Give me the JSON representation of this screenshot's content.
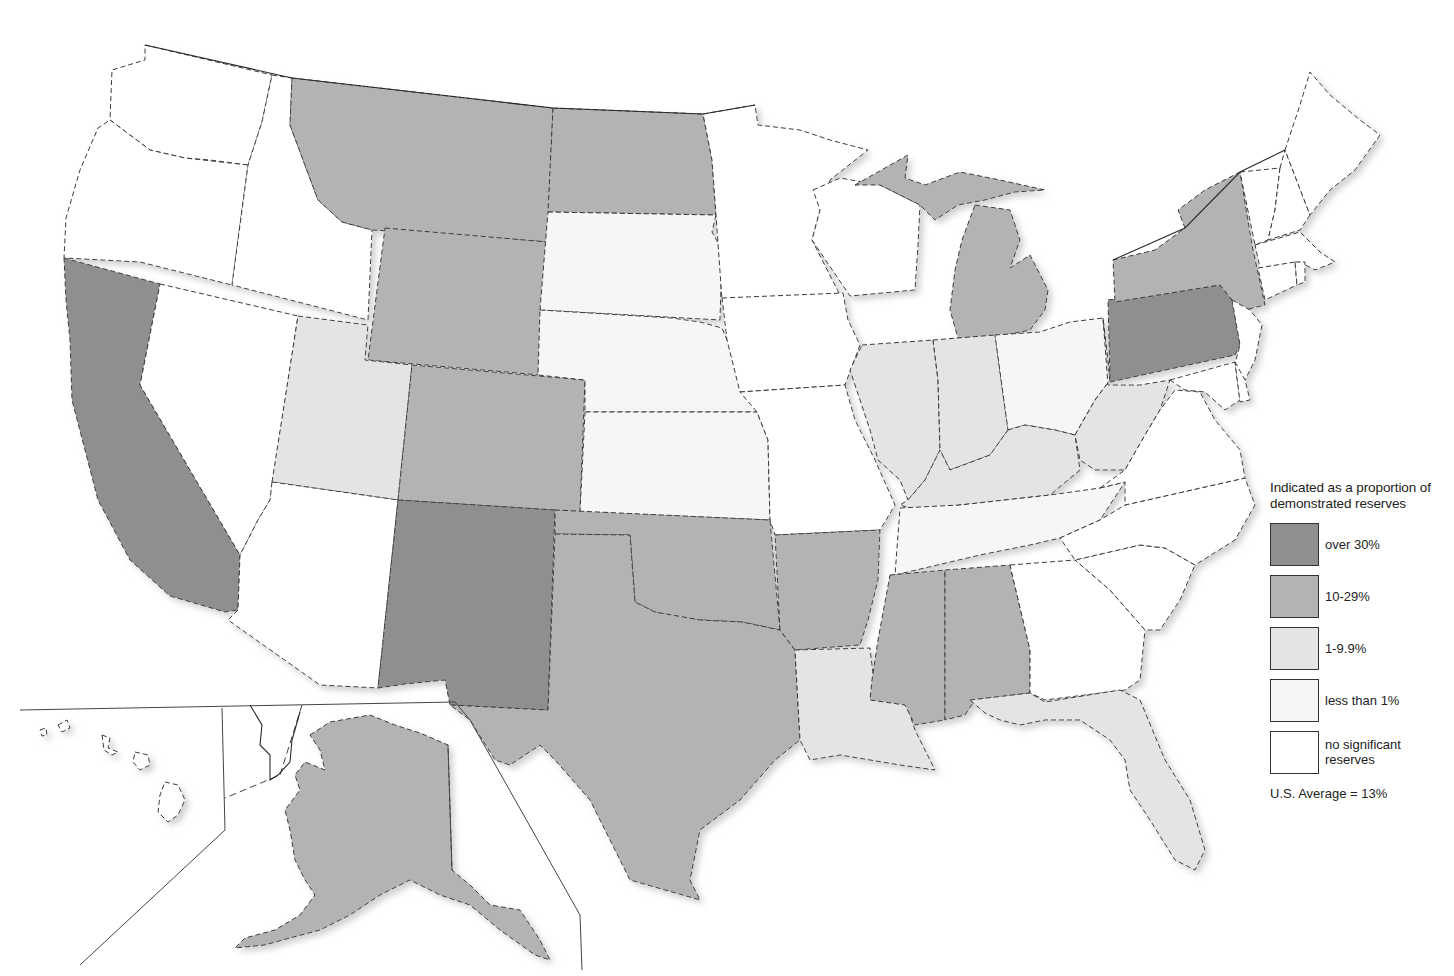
{
  "map": {
    "title": "Indicated as a proportion of demonstrated reserves",
    "colors": {
      "over_30": "#8f8f8f",
      "10_29": "#b3b3b3",
      "1_9_9": "#e4e4e4",
      "lt_1": "#f6f6f6",
      "none": "#ffffff"
    },
    "states": {
      "WA": "none",
      "OR": "none",
      "CA": "over_30",
      "NV": "none",
      "ID": "none",
      "MT": "10_29",
      "WY": "10_29",
      "UT": "1_9_9",
      "AZ": "none",
      "CO": "10_29",
      "NM": "over_30",
      "ND": "10_29",
      "SD": "lt_1",
      "NE": "lt_1",
      "KS": "lt_1",
      "OK": "10_29",
      "TX": "10_29",
      "MN": "none",
      "IA": "none",
      "MO": "none",
      "AR": "10_29",
      "LA": "1_9_9",
      "WI": "none",
      "IL": "1_9_9",
      "MI": "10_29",
      "IN": "1_9_9",
      "OH": "lt_1",
      "KY": "1_9_9",
      "TN": "lt_1",
      "MS": "10_29",
      "AL": "10_29",
      "GA": "none",
      "FL": "1_9_9",
      "SC": "none",
      "NC": "none",
      "VA": "none",
      "WV": "1_9_9",
      "PA": "over_30",
      "NY": "10_29",
      "NJ": "none",
      "MD": "none",
      "DE": "none",
      "VT": "none",
      "NH": "none",
      "ME": "none",
      "MA": "none",
      "CT": "none",
      "RI": "none",
      "AK": "10_29",
      "HI": "none"
    }
  },
  "legend": {
    "title": "Indicated as a proportion of demonstrated reserves",
    "items": [
      {
        "key": "over_30",
        "label": "over 30%"
      },
      {
        "key": "10_29",
        "label": "10-29%"
      },
      {
        "key": "1_9_9",
        "label": "1-9.9%"
      },
      {
        "key": "lt_1",
        "label": "less than 1%"
      },
      {
        "key": "none",
        "label": "no significant reserves"
      }
    ],
    "average": "U.S. Average = 13%"
  }
}
